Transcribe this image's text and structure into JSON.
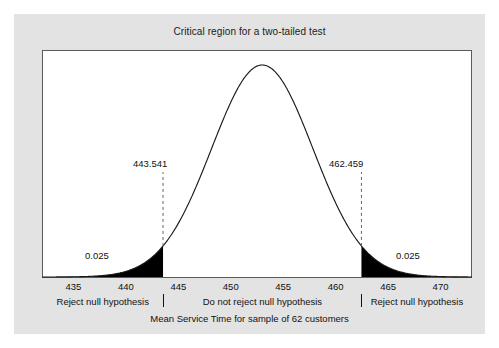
{
  "chart_data": {
    "type": "area",
    "title": "Critical region for a two-tailed test",
    "xlabel": "Mean Service Time for sample of 62 customers",
    "ylabel": "",
    "xlim": [
      432.0,
      473.0
    ],
    "ylim": [
      0,
      1.08
    ],
    "grid": false,
    "legend": null,
    "distribution": {
      "kind": "normal",
      "mean": 453.0,
      "std_dev": 4.826,
      "sample_size": 62
    },
    "x_ticks": [
      435,
      440,
      445,
      450,
      455,
      460,
      465,
      470
    ],
    "x_tick_labels": [
      "435",
      "440",
      "445",
      "450",
      "455",
      "460",
      "465",
      "470"
    ],
    "critical_values": [
      443.541,
      462.459
    ],
    "critical_value_labels": [
      "443.541",
      "462.459"
    ],
    "tail_areas": [
      0.025,
      0.025
    ],
    "tail_area_labels": [
      "0.025",
      "0.025"
    ],
    "significance_level": 0.05,
    "regions": [
      {
        "name": "lower-rejection-region",
        "label": "Reject null hypothesis",
        "from": 432.0,
        "to": 443.541,
        "shaded": true
      },
      {
        "name": "acceptance-region",
        "label": "Do not reject null hypothesis",
        "from": 443.541,
        "to": 462.459,
        "shaded": false
      },
      {
        "name": "upper-rejection-region",
        "label": "Reject null hypothesis",
        "from": 462.459,
        "to": 473.0,
        "shaded": true
      }
    ],
    "colors": {
      "shade": "#000000",
      "curve": "#1a1a1a",
      "plot_background": "#ffffff",
      "figure_background": "#e3e3e3",
      "axis": "#5a5a5a",
      "text": "#111111",
      "dashed_line": "#666666"
    }
  },
  "figure": {
    "title": "Critical region for a two-tailed test",
    "axis_title": "Mean Service Time for sample of 62 customers"
  },
  "annotations": {
    "crit_left": "443.541",
    "crit_right": "462.459",
    "alpha_left": "0.025",
    "alpha_right": "0.025"
  },
  "ticks": [
    {
      "label": "435"
    },
    {
      "label": "440"
    },
    {
      "label": "445"
    },
    {
      "label": "450"
    },
    {
      "label": "455"
    },
    {
      "label": "460"
    },
    {
      "label": "465"
    },
    {
      "label": "470"
    }
  ],
  "regions": [
    {
      "label": "Reject null hypothesis"
    },
    {
      "label": "Do not reject null hypothesis"
    },
    {
      "label": "Reject null hypothesis"
    }
  ]
}
